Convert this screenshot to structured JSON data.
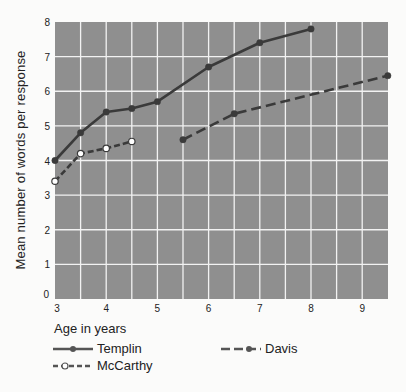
{
  "chart_data": {
    "type": "line",
    "title": "",
    "xlabel": "Age in years",
    "ylabel": "Mean number of words per response",
    "xlim": [
      3,
      9.5
    ],
    "ylim": [
      0,
      8
    ],
    "x_ticks": [
      3,
      4,
      5,
      6,
      7,
      8,
      9
    ],
    "y_ticks": [
      0,
      1,
      2,
      3,
      4,
      5,
      6,
      7,
      8
    ],
    "grid": true,
    "grid_step_x": 0.5,
    "grid_step_y": 1,
    "background": "#8f8f8f",
    "grid_color": "#f2f2f2",
    "legend_position": "bottom",
    "series": [
      {
        "name": "Templin",
        "style": "solid",
        "marker": "filled-circle",
        "color": "#3a3a3a",
        "points": [
          [
            3,
            4.0
          ],
          [
            3.5,
            4.8
          ],
          [
            4,
            5.4
          ],
          [
            4.5,
            5.5
          ],
          [
            5,
            5.7
          ],
          [
            6,
            6.7
          ],
          [
            7,
            7.4
          ],
          [
            8,
            7.8
          ]
        ]
      },
      {
        "name": "McCarthy",
        "style": "dashed",
        "marker": "open-circle",
        "color": "#3a3a3a",
        "points": [
          [
            3,
            3.4
          ],
          [
            3.5,
            4.2
          ],
          [
            4,
            4.35
          ],
          [
            4.5,
            4.55
          ]
        ]
      },
      {
        "name": "Davis",
        "style": "long-dashed",
        "marker": "filled-circle",
        "color": "#3a3a3a",
        "points": [
          [
            5.5,
            4.6
          ],
          [
            6.5,
            5.35
          ],
          [
            9.5,
            6.45
          ]
        ]
      }
    ]
  },
  "axis": {
    "xlabel": "Age in years",
    "ylabel": "Mean number of words per response"
  },
  "legend": {
    "templin": "Templin",
    "mccarthy": "McCarthy",
    "davis": "Davis"
  }
}
